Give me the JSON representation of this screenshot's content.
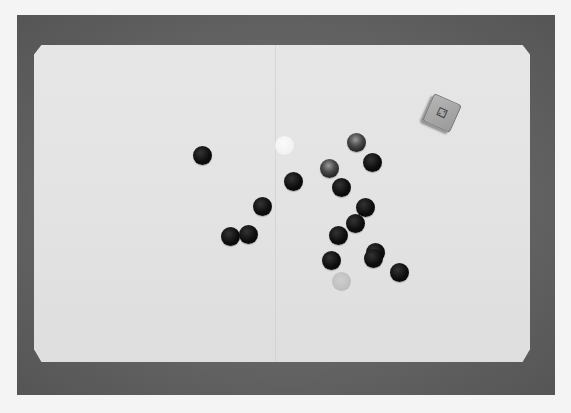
{
  "scene": {
    "description": "Black-and-white photograph of a game board with round stones and a die on a dark surface",
    "colors": {
      "page_background": "#f4f4f4",
      "table_surface": "#666666",
      "board": "#e4e4e4",
      "dark_stone": "#0d0d0d",
      "white_stone": "#f2f2f2"
    }
  },
  "die": {
    "glyph": "⚁",
    "label": "die"
  },
  "stones": [
    {
      "x": 202,
      "y": 155,
      "kind": "dark"
    },
    {
      "x": 284,
      "y": 145,
      "kind": "white"
    },
    {
      "x": 293,
      "y": 181,
      "kind": "dark"
    },
    {
      "x": 262,
      "y": 206,
      "kind": "dark"
    },
    {
      "x": 230,
      "y": 236,
      "kind": "dark"
    },
    {
      "x": 248,
      "y": 234,
      "kind": "dark"
    },
    {
      "x": 356,
      "y": 142,
      "kind": "glassy"
    },
    {
      "x": 372,
      "y": 162,
      "kind": "dark"
    },
    {
      "x": 329,
      "y": 168,
      "kind": "glassy"
    },
    {
      "x": 341,
      "y": 187,
      "kind": "dark"
    },
    {
      "x": 365,
      "y": 207,
      "kind": "dark"
    },
    {
      "x": 355,
      "y": 223,
      "kind": "dark"
    },
    {
      "x": 338,
      "y": 235,
      "kind": "dark"
    },
    {
      "x": 375,
      "y": 252,
      "kind": "dark"
    },
    {
      "x": 373,
      "y": 258,
      "kind": "dark"
    },
    {
      "x": 331,
      "y": 260,
      "kind": "dark"
    },
    {
      "x": 341,
      "y": 281,
      "kind": "light"
    },
    {
      "x": 399,
      "y": 272,
      "kind": "dark"
    }
  ]
}
